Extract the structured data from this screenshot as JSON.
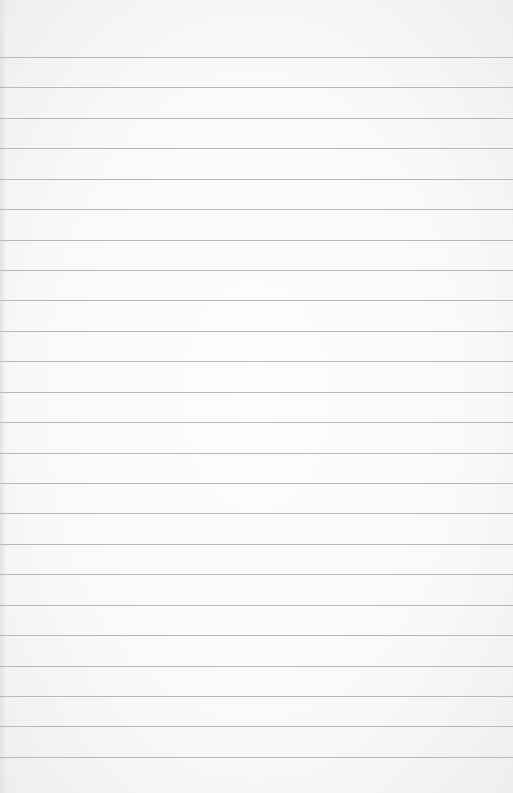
{
  "paper": {
    "background_color": "#fafafa",
    "rule_color": "#b9b9b9",
    "rule_count": 24,
    "first_rule_y": 57,
    "rule_spacing": 30.43
  }
}
